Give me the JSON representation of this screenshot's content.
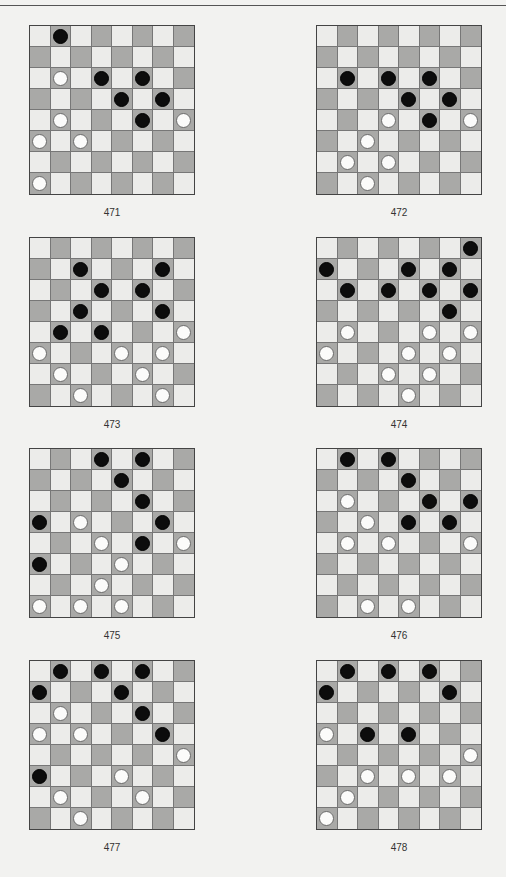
{
  "page": {
    "layout": {
      "columns": 2,
      "rows": 4
    },
    "diagrams": [
      {
        "number": "471",
        "black": [
          [
            0,
            1
          ],
          [
            2,
            3
          ],
          [
            2,
            5
          ],
          [
            3,
            4
          ],
          [
            3,
            6
          ],
          [
            4,
            5
          ]
        ],
        "white": [
          [
            2,
            1
          ],
          [
            4,
            1
          ],
          [
            4,
            7
          ],
          [
            5,
            0
          ],
          [
            5,
            2
          ],
          [
            7,
            0
          ]
        ]
      },
      {
        "number": "472",
        "black": [
          [
            2,
            1
          ],
          [
            2,
            3
          ],
          [
            2,
            5
          ],
          [
            3,
            4
          ],
          [
            3,
            6
          ],
          [
            4,
            5
          ]
        ],
        "white": [
          [
            4,
            3
          ],
          [
            4,
            7
          ],
          [
            5,
            2
          ],
          [
            6,
            1
          ],
          [
            6,
            3
          ],
          [
            7,
            2
          ]
        ]
      },
      {
        "number": "473",
        "black": [
          [
            1,
            2
          ],
          [
            1,
            6
          ],
          [
            2,
            3
          ],
          [
            2,
            5
          ],
          [
            3,
            2
          ],
          [
            3,
            6
          ],
          [
            4,
            1
          ],
          [
            4,
            3
          ]
        ],
        "white": [
          [
            4,
            7
          ],
          [
            5,
            0
          ],
          [
            5,
            4
          ],
          [
            5,
            6
          ],
          [
            6,
            1
          ],
          [
            6,
            5
          ],
          [
            7,
            2
          ],
          [
            7,
            6
          ]
        ]
      },
      {
        "number": "474",
        "black": [
          [
            0,
            7
          ],
          [
            1,
            0
          ],
          [
            1,
            4
          ],
          [
            1,
            6
          ],
          [
            2,
            1
          ],
          [
            2,
            3
          ],
          [
            2,
            5
          ],
          [
            2,
            7
          ],
          [
            3,
            6
          ]
        ],
        "white": [
          [
            4,
            1
          ],
          [
            4,
            5
          ],
          [
            4,
            7
          ],
          [
            5,
            0
          ],
          [
            5,
            4
          ],
          [
            5,
            6
          ],
          [
            6,
            3
          ],
          [
            6,
            5
          ],
          [
            7,
            4
          ]
        ]
      },
      {
        "number": "475",
        "black": [
          [
            0,
            3
          ],
          [
            0,
            5
          ],
          [
            1,
            4
          ],
          [
            2,
            5
          ],
          [
            3,
            0
          ],
          [
            3,
            6
          ],
          [
            4,
            5
          ],
          [
            5,
            0
          ]
        ],
        "white": [
          [
            3,
            2
          ],
          [
            4,
            3
          ],
          [
            4,
            7
          ],
          [
            5,
            4
          ],
          [
            6,
            3
          ],
          [
            7,
            0
          ],
          [
            7,
            2
          ],
          [
            7,
            4
          ]
        ]
      },
      {
        "number": "476",
        "black": [
          [
            0,
            1
          ],
          [
            0,
            3
          ],
          [
            1,
            4
          ],
          [
            2,
            5
          ],
          [
            2,
            7
          ],
          [
            3,
            4
          ],
          [
            3,
            6
          ]
        ],
        "white": [
          [
            2,
            1
          ],
          [
            3,
            2
          ],
          [
            4,
            1
          ],
          [
            4,
            3
          ],
          [
            4,
            7
          ],
          [
            7,
            2
          ],
          [
            7,
            4
          ]
        ]
      },
      {
        "number": "477",
        "black": [
          [
            0,
            1
          ],
          [
            0,
            3
          ],
          [
            0,
            5
          ],
          [
            1,
            0
          ],
          [
            1,
            4
          ],
          [
            2,
            5
          ],
          [
            3,
            6
          ],
          [
            5,
            0
          ]
        ],
        "white": [
          [
            2,
            1
          ],
          [
            3,
            0
          ],
          [
            3,
            2
          ],
          [
            4,
            7
          ],
          [
            5,
            4
          ],
          [
            6,
            1
          ],
          [
            6,
            5
          ],
          [
            7,
            2
          ]
        ]
      },
      {
        "number": "478",
        "black": [
          [
            0,
            1
          ],
          [
            0,
            3
          ],
          [
            0,
            5
          ],
          [
            1,
            0
          ],
          [
            1,
            6
          ],
          [
            3,
            2
          ],
          [
            3,
            4
          ]
        ],
        "white": [
          [
            3,
            0
          ],
          [
            4,
            7
          ],
          [
            5,
            2
          ],
          [
            5,
            4
          ],
          [
            5,
            6
          ],
          [
            6,
            1
          ],
          [
            7,
            0
          ]
        ]
      }
    ]
  },
  "colors": {
    "light_square": "#ececea",
    "dark_square": "#a9a9a7",
    "black_piece": "#0c0c0c",
    "white_piece": "#fbfbfa"
  },
  "piece_icons": {
    "black": "black-checker-icon",
    "white": "white-checker-icon"
  }
}
